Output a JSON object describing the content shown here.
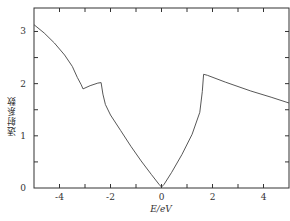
{
  "chart_data": {
    "type": "line",
    "title": "",
    "xlabel": "E/eV",
    "ylabel": "透射系数",
    "xlim": [
      -5,
      5
    ],
    "ylim": [
      0,
      3.45
    ],
    "xticks": [
      -4,
      -2,
      0,
      2,
      4
    ],
    "xtick_labels": [
      "-4",
      "-2",
      "0",
      "2",
      "4"
    ],
    "xminor": [
      -5,
      -4,
      -3,
      -2,
      -1,
      0,
      1,
      2,
      3,
      4,
      5
    ],
    "yticks": [
      0,
      1,
      2,
      3
    ],
    "ytick_labels": [
      "0",
      "1",
      "2",
      "3"
    ],
    "grid": false,
    "legend": null,
    "series": [
      {
        "name": "transmission",
        "x": [
          -5.0,
          -4.6,
          -4.2,
          -3.8,
          -3.5,
          -3.3,
          -3.15,
          -3.08,
          -2.8,
          -2.5,
          -2.37,
          -2.3,
          -2.2,
          -2.0,
          -1.6,
          -1.2,
          -0.8,
          -0.4,
          -0.1,
          0.0,
          0.1,
          0.4,
          0.8,
          1.2,
          1.5,
          1.6,
          1.65,
          1.8,
          2.5,
          3.5,
          4.3,
          5.0
        ],
        "y": [
          3.13,
          2.97,
          2.78,
          2.55,
          2.33,
          2.12,
          1.98,
          1.9,
          1.96,
          2.01,
          2.02,
          1.8,
          1.6,
          1.4,
          1.1,
          0.8,
          0.52,
          0.26,
          0.07,
          0.02,
          0.07,
          0.3,
          0.64,
          1.03,
          1.45,
          1.85,
          2.18,
          2.16,
          2.03,
          1.86,
          1.74,
          1.63
        ]
      }
    ],
    "colors": {
      "line": "#444444",
      "axis": "#333333"
    }
  }
}
